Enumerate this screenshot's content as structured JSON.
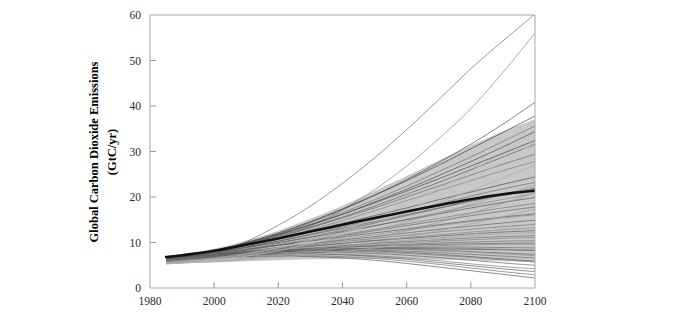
{
  "figure": {
    "background_color": "#ffffff",
    "border_color": "#b9b9b9",
    "axis_color": "#a8a8a8"
  },
  "chart_data": {
    "type": "line",
    "title": "",
    "subtitle": "",
    "xlabel": "",
    "ylabel": "Global Carbon Dioxide Emissions\n(GtC/yr)",
    "ylabel_line1": "Global Carbon Dioxide Emissions",
    "ylabel_line2": "(GtC/yr)",
    "xlim": [
      1980,
      2100
    ],
    "ylim": [
      0,
      60
    ],
    "xticks": [
      1980,
      2000,
      2020,
      2040,
      2060,
      2080,
      2100
    ],
    "yticks": [
      0,
      10,
      20,
      30,
      40,
      50,
      60
    ],
    "xtick_labels": [
      "1980",
      "2000",
      "2020",
      "2040",
      "2060",
      "2080",
      "2100"
    ],
    "ytick_labels": [
      "0",
      "10",
      "20",
      "30",
      "40",
      "50",
      "60"
    ],
    "grid": false,
    "legend": "none",
    "x_units": "year",
    "y_units": "GtC/yr",
    "x": [
      1985,
      1990,
      2000,
      2010,
      2020,
      2030,
      2040,
      2050,
      2060,
      2070,
      2080,
      2090,
      2100
    ],
    "shaded_band": {
      "name": "scenario-envelope",
      "fill_color": "#b3b3b3",
      "opacity": 0.72,
      "upper": [
        6.6,
        7.3,
        8.6,
        10.4,
        12.6,
        15.2,
        18.1,
        21.3,
        24.6,
        28.0,
        31.4,
        34.4,
        37.1
      ],
      "lower": [
        5.3,
        5.4,
        5.6,
        5.9,
        6.1,
        6.3,
        6.4,
        6.4,
        6.3,
        6.2,
        6.1,
        5.9,
        5.6
      ]
    },
    "reference_line": {
      "name": "median-reference-scenario",
      "color": "#111111",
      "width": 2.6,
      "values": [
        6.8,
        7.2,
        8.2,
        9.5,
        10.9,
        12.4,
        13.9,
        15.4,
        16.8,
        18.2,
        19.5,
        20.6,
        21.4
      ]
    },
    "series": [
      {
        "name": "scenario-01",
        "color": "#6f6f6f",
        "width": 0.85,
        "values": [
          5.6,
          6.1,
          7.6,
          10.2,
          13.8,
          18.0,
          23.0,
          28.6,
          34.8,
          41.4,
          48.2,
          54.3,
          60.2
        ]
      },
      {
        "name": "scenario-02",
        "color": "#8a8a8a",
        "width": 0.85,
        "values": [
          5.5,
          5.9,
          7.0,
          8.6,
          10.8,
          13.6,
          17.2,
          21.6,
          26.8,
          32.8,
          39.4,
          47.4,
          56.0
        ]
      },
      {
        "name": "scenario-03",
        "color": "#555555",
        "width": 0.85,
        "values": [
          6.2,
          6.7,
          8.0,
          9.8,
          11.9,
          14.4,
          17.2,
          20.4,
          23.8,
          27.6,
          31.6,
          36.0,
          40.8
        ]
      },
      {
        "name": "scenario-04",
        "color": "#444444",
        "width": 0.85,
        "values": [
          6.4,
          6.9,
          8.2,
          10.0,
          12.1,
          14.6,
          17.4,
          20.4,
          23.6,
          27.0,
          30.6,
          34.2,
          37.8
        ]
      },
      {
        "name": "scenario-05",
        "color": "#777777",
        "width": 0.85,
        "values": [
          6.0,
          6.5,
          7.8,
          9.5,
          11.6,
          14.0,
          16.6,
          19.4,
          22.4,
          25.6,
          28.8,
          32.2,
          35.6
        ]
      },
      {
        "name": "scenario-06",
        "color": "#5e5e5e",
        "width": 0.85,
        "values": [
          6.3,
          6.8,
          8.0,
          9.6,
          11.4,
          13.4,
          15.6,
          18.0,
          20.6,
          23.2,
          26.0,
          28.8,
          31.6
        ]
      },
      {
        "name": "scenario-07",
        "color": "#6a6a6a",
        "width": 0.85,
        "values": [
          6.1,
          6.6,
          7.8,
          9.4,
          11.2,
          13.2,
          15.4,
          17.6,
          20.0,
          22.4,
          24.8,
          27.2,
          29.4
        ]
      },
      {
        "name": "scenario-08",
        "color": "#838383",
        "width": 0.85,
        "values": [
          5.8,
          6.3,
          7.5,
          9.0,
          10.8,
          12.8,
          14.8,
          17.0,
          19.2,
          21.4,
          23.6,
          25.8,
          27.8
        ]
      },
      {
        "name": "scenario-09",
        "color": "#4f4f4f",
        "width": 0.85,
        "values": [
          6.5,
          7.0,
          8.1,
          9.5,
          11.0,
          12.6,
          14.2,
          15.9,
          17.6,
          19.4,
          21.1,
          22.8,
          24.4
        ]
      },
      {
        "name": "scenario-10",
        "color": "#707070",
        "width": 0.85,
        "values": [
          6.2,
          6.6,
          7.6,
          8.9,
          10.3,
          11.8,
          13.4,
          15.1,
          16.8,
          18.5,
          20.2,
          21.8,
          23.2
        ]
      },
      {
        "name": "scenario-11",
        "color": "#626262",
        "width": 0.85,
        "values": [
          6.4,
          6.8,
          7.8,
          9.0,
          10.3,
          11.7,
          13.1,
          14.6,
          16.1,
          17.6,
          19.1,
          20.4,
          21.6
        ]
      },
      {
        "name": "scenario-12",
        "color": "#8d8d8d",
        "width": 0.85,
        "values": [
          5.9,
          6.3,
          7.2,
          8.3,
          9.5,
          10.8,
          12.2,
          13.6,
          15.1,
          16.6,
          18.1,
          19.5,
          20.8
        ]
      },
      {
        "name": "scenario-13",
        "color": "#565656",
        "width": 0.85,
        "values": [
          6.6,
          7.0,
          7.9,
          8.9,
          10.0,
          11.2,
          12.4,
          13.7,
          15.0,
          16.3,
          17.6,
          18.8,
          19.9
        ]
      },
      {
        "name": "scenario-14",
        "color": "#7c7c7c",
        "width": 0.85,
        "values": [
          6.0,
          6.4,
          7.3,
          8.3,
          9.4,
          10.5,
          11.7,
          12.9,
          14.1,
          15.3,
          16.5,
          17.6,
          18.6
        ]
      },
      {
        "name": "scenario-15",
        "color": "#6b6b6b",
        "width": 0.85,
        "values": [
          6.3,
          6.7,
          7.5,
          8.4,
          9.4,
          10.4,
          11.5,
          12.6,
          13.7,
          14.8,
          15.9,
          16.9,
          17.8
        ]
      },
      {
        "name": "scenario-16",
        "color": "#5a5a5a",
        "width": 0.85,
        "values": [
          6.5,
          6.9,
          7.7,
          8.5,
          9.4,
          10.3,
          11.2,
          12.1,
          13.0,
          13.9,
          14.8,
          15.6,
          16.3
        ]
      },
      {
        "name": "scenario-17",
        "color": "#909090",
        "width": 0.85,
        "values": [
          5.7,
          6.1,
          6.9,
          7.8,
          8.8,
          9.7,
          10.7,
          11.7,
          12.7,
          13.7,
          14.6,
          15.4,
          16.1
        ]
      },
      {
        "name": "scenario-18",
        "color": "#666666",
        "width": 0.85,
        "values": [
          6.2,
          6.6,
          7.3,
          8.1,
          8.9,
          9.7,
          10.5,
          11.3,
          12.1,
          12.9,
          13.6,
          14.3,
          14.9
        ]
      },
      {
        "name": "scenario-19",
        "color": "#7a7a7a",
        "width": 0.85,
        "values": [
          6.0,
          6.4,
          7.1,
          7.9,
          8.7,
          9.4,
          10.2,
          10.9,
          11.6,
          12.3,
          12.9,
          13.5,
          14.0
        ]
      },
      {
        "name": "scenario-20",
        "color": "#888888",
        "width": 0.85,
        "values": [
          5.8,
          6.2,
          6.9,
          7.6,
          8.4,
          9.1,
          9.8,
          10.5,
          11.1,
          11.7,
          12.3,
          12.8,
          13.2
        ]
      },
      {
        "name": "scenario-21",
        "color": "#5c5c5c",
        "width": 0.85,
        "values": [
          6.4,
          6.8,
          7.4,
          8.0,
          8.6,
          9.2,
          9.8,
          10.4,
          10.9,
          11.4,
          11.9,
          12.3,
          12.6
        ]
      },
      {
        "name": "scenario-22",
        "color": "#9a9a9a",
        "width": 0.85,
        "values": [
          5.5,
          5.9,
          6.6,
          7.3,
          8.0,
          8.7,
          9.3,
          9.9,
          10.5,
          11.0,
          11.5,
          11.9,
          12.2
        ]
      },
      {
        "name": "scenario-23",
        "color": "#6e6e6e",
        "width": 0.85,
        "values": [
          6.1,
          6.5,
          7.1,
          7.7,
          8.3,
          8.8,
          9.3,
          9.8,
          10.2,
          10.6,
          11.0,
          11.3,
          11.5
        ]
      },
      {
        "name": "scenario-24",
        "color": "#838383",
        "width": 0.85,
        "values": [
          5.9,
          6.3,
          6.9,
          7.5,
          8.1,
          8.6,
          9.1,
          9.5,
          9.9,
          10.3,
          10.6,
          10.9,
          11.1
        ]
      },
      {
        "name": "scenario-25",
        "color": "#747474",
        "width": 0.85,
        "values": [
          6.3,
          6.6,
          7.2,
          7.7,
          8.2,
          8.6,
          9.0,
          9.3,
          9.6,
          9.9,
          10.1,
          10.3,
          10.4
        ]
      },
      {
        "name": "scenario-26",
        "color": "#606060",
        "width": 0.85,
        "values": [
          6.5,
          6.9,
          7.4,
          7.9,
          8.3,
          8.6,
          8.9,
          9.2,
          9.4,
          9.6,
          9.7,
          9.8,
          9.9
        ]
      },
      {
        "name": "scenario-27",
        "color": "#8e8e8e",
        "width": 0.85,
        "values": [
          5.6,
          6.0,
          6.6,
          7.2,
          7.7,
          8.1,
          8.5,
          8.8,
          9.1,
          9.3,
          9.5,
          9.6,
          9.6
        ]
      },
      {
        "name": "scenario-28",
        "color": "#6c6c6c",
        "width": 0.85,
        "values": [
          6.0,
          6.4,
          6.9,
          7.4,
          7.9,
          8.3,
          8.6,
          8.8,
          8.9,
          9.0,
          9.0,
          8.9,
          8.8
        ]
      },
      {
        "name": "scenario-29",
        "color": "#585858",
        "width": 0.85,
        "values": [
          6.4,
          6.7,
          7.2,
          7.7,
          8.1,
          8.4,
          8.6,
          8.7,
          8.7,
          8.6,
          8.5,
          8.4,
          8.2
        ]
      },
      {
        "name": "scenario-30",
        "color": "#808080",
        "width": 0.85,
        "values": [
          5.8,
          6.2,
          6.8,
          7.3,
          7.8,
          8.2,
          8.5,
          8.7,
          8.8,
          8.8,
          8.7,
          8.5,
          8.3
        ]
      },
      {
        "name": "scenario-31",
        "color": "#666666",
        "width": 0.85,
        "values": [
          6.2,
          6.6,
          7.1,
          7.6,
          8.0,
          8.3,
          8.5,
          8.6,
          8.5,
          8.3,
          8.0,
          7.7,
          7.4
        ]
      },
      {
        "name": "scenario-32",
        "color": "#949494",
        "width": 0.85,
        "values": [
          5.5,
          5.9,
          6.5,
          7.1,
          7.6,
          8.0,
          8.3,
          8.4,
          8.4,
          8.2,
          7.9,
          7.5,
          7.1
        ]
      },
      {
        "name": "scenario-33",
        "color": "#717171",
        "width": 0.85,
        "values": [
          6.1,
          6.5,
          7.0,
          7.5,
          7.9,
          8.2,
          8.3,
          8.3,
          8.1,
          7.8,
          7.4,
          7.0,
          6.6
        ]
      },
      {
        "name": "scenario-34",
        "color": "#5d5d5d",
        "width": 0.85,
        "values": [
          6.5,
          6.8,
          7.3,
          7.7,
          8.0,
          8.2,
          8.2,
          8.1,
          7.8,
          7.4,
          6.9,
          6.4,
          5.9
        ]
      },
      {
        "name": "scenario-35",
        "color": "#878787",
        "width": 0.85,
        "values": [
          5.7,
          6.1,
          6.7,
          7.2,
          7.6,
          7.9,
          8.0,
          7.9,
          7.6,
          7.2,
          6.7,
          6.2,
          5.7
        ]
      },
      {
        "name": "scenario-36",
        "color": "#6a6a6a",
        "width": 0.85,
        "values": [
          6.0,
          6.4,
          6.9,
          7.3,
          7.6,
          7.8,
          7.8,
          7.6,
          7.2,
          6.7,
          6.1,
          5.5,
          5.0
        ]
      },
      {
        "name": "scenario-37",
        "color": "#7e7e7e",
        "width": 0.85,
        "values": [
          5.9,
          6.2,
          6.7,
          7.1,
          7.4,
          7.5,
          7.4,
          7.1,
          6.6,
          6.0,
          5.3,
          4.7,
          4.2
        ]
      },
      {
        "name": "scenario-38",
        "color": "#636363",
        "width": 0.85,
        "values": [
          6.3,
          6.6,
          7.0,
          7.3,
          7.5,
          7.5,
          7.3,
          6.9,
          6.3,
          5.6,
          4.9,
          4.2,
          3.6
        ]
      },
      {
        "name": "scenario-39",
        "color": "#757575",
        "width": 0.85,
        "values": [
          5.6,
          6.0,
          6.5,
          6.9,
          7.1,
          7.1,
          6.9,
          6.5,
          5.9,
          5.2,
          4.4,
          3.6,
          2.9
        ]
      },
      {
        "name": "scenario-40",
        "color": "#5f5f5f",
        "width": 0.85,
        "values": [
          6.2,
          6.4,
          6.7,
          6.9,
          7.0,
          6.9,
          6.6,
          6.1,
          5.4,
          4.6,
          3.8,
          3.0,
          2.2
        ]
      },
      {
        "name": "scenario-41",
        "color": "#999999",
        "width": 0.85,
        "values": [
          5.4,
          5.6,
          6.0,
          6.6,
          7.4,
          8.4,
          9.6,
          11.0,
          12.6,
          14.4,
          16.4,
          18.6,
          21.0
        ]
      },
      {
        "name": "scenario-42",
        "color": "#a0a0a0",
        "width": 0.85,
        "values": [
          5.3,
          5.5,
          5.9,
          6.4,
          7.1,
          7.9,
          8.9,
          10.0,
          11.2,
          12.6,
          14.1,
          15.7,
          17.4
        ]
      },
      {
        "name": "scenario-43",
        "color": "#b0b0b0",
        "width": 0.85,
        "values": [
          5.3,
          5.5,
          5.8,
          6.2,
          6.7,
          7.3,
          8.0,
          8.8,
          9.7,
          10.7,
          11.8,
          13.0,
          14.2
        ]
      },
      {
        "name": "scenario-44",
        "color": "#c0c0c0",
        "width": 0.85,
        "values": [
          5.4,
          5.6,
          6.1,
          7.0,
          8.2,
          9.8,
          11.8,
          14.2,
          17.0,
          20.2,
          23.8,
          27.8,
          32.0
        ]
      },
      {
        "name": "scenario-45",
        "color": "#b8b8b8",
        "width": 0.85,
        "values": [
          5.5,
          5.8,
          6.4,
          7.4,
          8.8,
          10.6,
          12.8,
          15.4,
          18.4,
          21.8,
          25.6,
          29.8,
          34.2
        ]
      },
      {
        "name": "scenario-46",
        "color": "#adadad",
        "width": 0.85,
        "values": [
          5.6,
          5.9,
          6.6,
          7.6,
          8.9,
          10.4,
          12.2,
          14.2,
          16.4,
          18.8,
          21.4,
          24.2,
          27.0
        ]
      },
      {
        "name": "scenario-47",
        "color": "#4a4a4a",
        "width": 0.85,
        "values": [
          6.6,
          7.1,
          8.3,
          9.9,
          11.8,
          13.9,
          16.2,
          18.7,
          21.3,
          24.0,
          26.8,
          29.6,
          32.4
        ]
      },
      {
        "name": "scenario-48",
        "color": "#515151",
        "width": 0.85,
        "values": [
          6.4,
          6.9,
          8.1,
          9.7,
          11.6,
          13.8,
          16.2,
          18.9,
          21.7,
          24.7,
          27.8,
          31.0,
          34.4
        ]
      },
      {
        "name": "scenario-49",
        "color": "#9d9d9d",
        "width": 0.85,
        "values": [
          5.4,
          5.7,
          6.3,
          7.2,
          8.3,
          9.6,
          11.1,
          12.7,
          14.5,
          16.4,
          18.4,
          20.5,
          22.6
        ]
      },
      {
        "name": "scenario-50",
        "color": "#6d6d6d",
        "width": 0.85,
        "values": [
          6.1,
          6.5,
          7.4,
          8.5,
          9.8,
          11.2,
          12.7,
          14.3,
          15.9,
          17.5,
          19.1,
          20.6,
          22.0
        ]
      }
    ]
  }
}
